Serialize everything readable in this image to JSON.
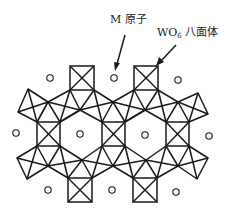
{
  "labels": {
    "m_atom": "M 原子",
    "wo6_prefix": "WO",
    "wo6_sub": "6",
    "wo6_suffix": " 八面体"
  },
  "legend_items": [
    {
      "symbol": "small-circle",
      "meaning": "M 原子"
    },
    {
      "symbol": "square-with-diagonals",
      "meaning": "WO6 八面体"
    }
  ],
  "structure": {
    "description": "Hexagonal tungsten bronze MxWO3 projection: corner-sharing WO6 octahedra forming hexagonal channels occupied by M atoms",
    "colors": {
      "line": "#1a1a1a",
      "background": "#ffffff"
    }
  }
}
